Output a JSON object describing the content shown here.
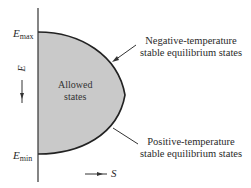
{
  "diagram": {
    "region_label": "Allowed states",
    "region_label_line1": "Allowed",
    "region_label_line2": "states",
    "axes": {
      "y_label": "E",
      "x_label": "S",
      "y_ticks": {
        "max": {
          "symbol": "E",
          "sub": "max"
        },
        "min": {
          "symbol": "E",
          "sub": "min"
        }
      }
    },
    "annotations": [
      {
        "id": "negative",
        "line1": "Negative-temperature",
        "line2": "stable equilibrium states"
      },
      {
        "id": "positive",
        "line1": "Positive-temperature",
        "line2": "stable equilibrium states"
      }
    ],
    "colors": {
      "fill": "#c9c9c9",
      "stroke": "#222222",
      "background": "#ffffff"
    }
  }
}
